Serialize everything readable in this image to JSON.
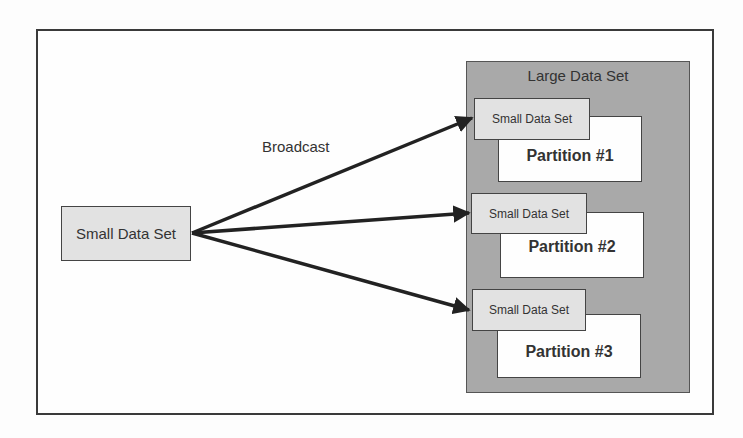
{
  "diagram": {
    "source": {
      "label": "Small Data Set"
    },
    "edge_label": "Broadcast",
    "target": {
      "label": "Large Data Set",
      "partitions": [
        {
          "label": "Partition #1",
          "copy_label": "Small Data Set"
        },
        {
          "label": "Partition #2",
          "copy_label": "Small Data Set"
        },
        {
          "label": "Partition #3",
          "copy_label": "Small Data Set"
        }
      ]
    },
    "edges": [
      {
        "from": "source",
        "to": "partition-1-copy"
      },
      {
        "from": "source",
        "to": "partition-2-copy"
      },
      {
        "from": "source",
        "to": "partition-3-copy"
      }
    ]
  }
}
